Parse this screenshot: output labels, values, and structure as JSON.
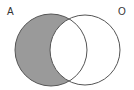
{
  "diagram": {
    "type": "venn",
    "sets": [
      {
        "id": "A",
        "label": "A",
        "cx": 51,
        "cy": 50,
        "r": 36
      },
      {
        "id": "O",
        "label": "O",
        "cx": 85,
        "cy": 50,
        "r": 35
      }
    ],
    "shaded_region": "A minus O",
    "colors": {
      "shade": "#9a9a9a",
      "outline": "#555555",
      "background": "#ffffff",
      "label": "#333333"
    }
  }
}
